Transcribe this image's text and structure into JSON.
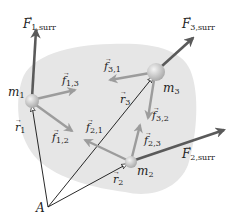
{
  "diagram": {
    "colors": {
      "background": "#ffffff",
      "system_region": "#e6e6e6",
      "external_force": "#5a5a5a",
      "internal_force": "#9a9a9a",
      "position_vector": "#111111",
      "sphere_light": "#f2f2f2",
      "sphere_dark": "#a8a8a8"
    },
    "masses": [
      {
        "id": "m1",
        "label": "m",
        "sub": "1"
      },
      {
        "id": "m2",
        "label": "m",
        "sub": "2"
      },
      {
        "id": "m3",
        "label": "m",
        "sub": "3"
      }
    ],
    "origin": {
      "label": "A"
    },
    "position_vectors": [
      {
        "id": "r1",
        "label": "r",
        "sub": "1"
      },
      {
        "id": "r2",
        "label": "r",
        "sub": "2"
      },
      {
        "id": "r3",
        "label": "r",
        "sub": "3"
      }
    ],
    "external_forces": [
      {
        "id": "F1surr",
        "label": "F",
        "sub": "1,surr"
      },
      {
        "id": "F2surr",
        "label": "F",
        "sub": "2,surr"
      },
      {
        "id": "F3surr",
        "label": "F",
        "sub": "3,surr"
      }
    ],
    "internal_forces": [
      {
        "id": "f13",
        "label": "f",
        "sub": "1,3"
      },
      {
        "id": "f12",
        "label": "f",
        "sub": "1,2"
      },
      {
        "id": "f21",
        "label": "f",
        "sub": "2,1"
      },
      {
        "id": "f23",
        "label": "f",
        "sub": "2,3"
      },
      {
        "id": "f31",
        "label": "f",
        "sub": "3,1"
      },
      {
        "id": "f32",
        "label": "f",
        "sub": "3,2"
      }
    ]
  }
}
